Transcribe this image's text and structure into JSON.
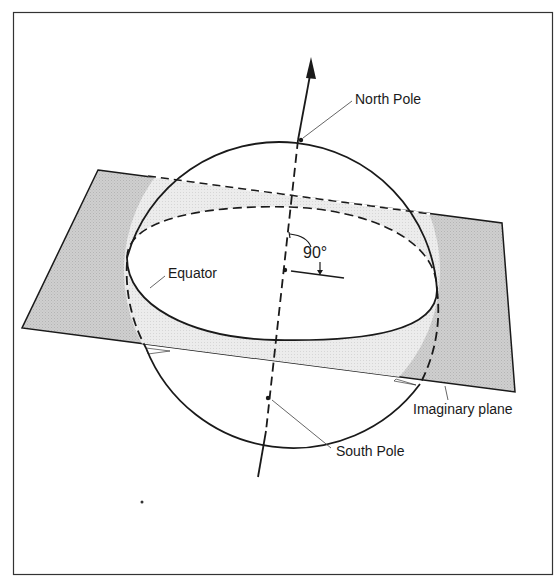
{
  "diagram": {
    "labels": {
      "north_pole": "North Pole",
      "south_pole": "South Pole",
      "equator": "Equator",
      "imaginary_plane": "Imaginary plane",
      "angle": "90°"
    },
    "colors": {
      "plane_fill": "#c8c8c8",
      "plane_back_fill": "#e6e6e6",
      "stroke": "#1a1a1a",
      "leader": "#555555",
      "background": "#ffffff"
    }
  }
}
